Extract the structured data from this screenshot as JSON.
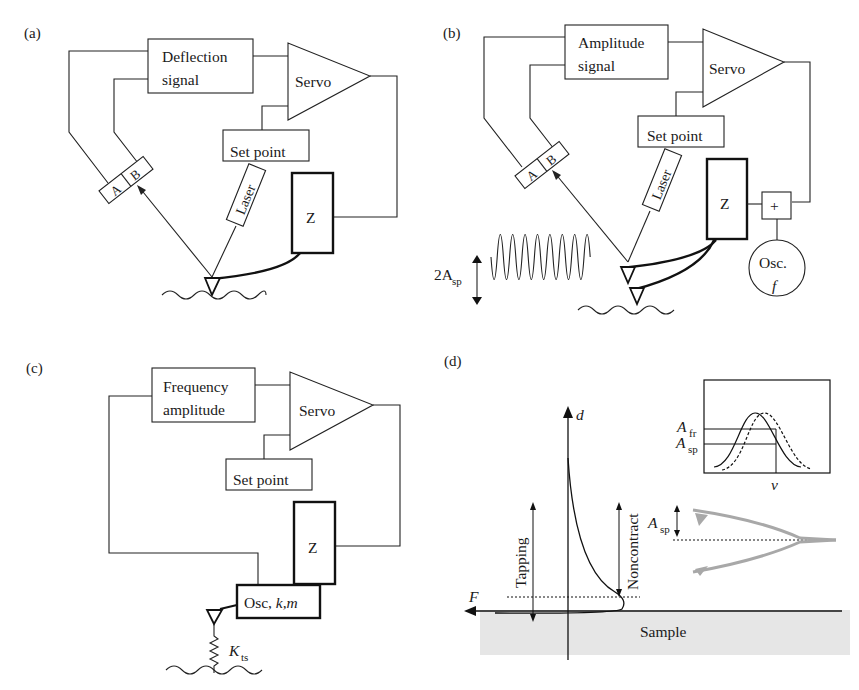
{
  "figure": {
    "panels": [
      {
        "id": "a",
        "label": "(a)",
        "signal_box": [
          "Deflection",
          "signal"
        ],
        "servo": "Servo",
        "set_point": "Set point",
        "laser": "Laser",
        "z": "Z",
        "detector": [
          "A",
          "B"
        ]
      },
      {
        "id": "b",
        "label": "(b)",
        "signal_box": [
          "Amplitude",
          "signal"
        ],
        "servo": "Servo",
        "set_point": "Set point",
        "laser": "Laser",
        "z": "Z",
        "detector": [
          "A",
          "B"
        ],
        "adder": "+",
        "oscillator": [
          "Osc.",
          "f"
        ],
        "amplitude_label": "2A",
        "amplitude_sub": "sp"
      },
      {
        "id": "c",
        "label": "(c)",
        "signal_box": [
          "Frequency",
          "amplitude"
        ],
        "servo": "Servo",
        "set_point": "Set point",
        "z": "Z",
        "oscillator": "Osc, k,m",
        "osc_plain": "Osc, ",
        "osc_italic": "k,m",
        "spring_label": "K",
        "spring_sub": "ts"
      },
      {
        "id": "d",
        "label": "(d)",
        "axis_d": "d",
        "axis_f": "F",
        "tapping": "Tapping",
        "noncontact": "Noncontract",
        "sample": "Sample",
        "asp_label": "A",
        "asp_sub": "sp",
        "inset": {
          "afr_label": "A",
          "afr_sub": "fr",
          "asp_label": "A",
          "asp_sub": "sp",
          "x_label": "ν"
        }
      }
    ],
    "colors": {
      "line": "#222222",
      "sample_fill": "#e6e6e6",
      "cantilever_gray": "#a8a8a8"
    }
  }
}
